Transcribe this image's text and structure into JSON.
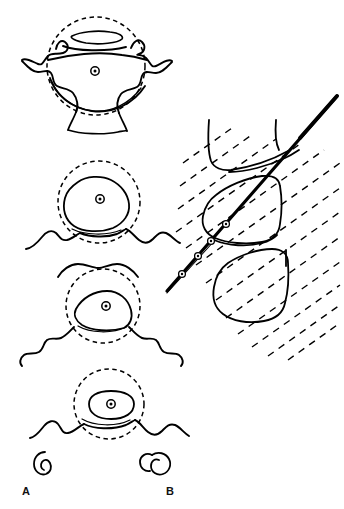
{
  "figure": {
    "background_color": "#ffffff",
    "ink_color": "#000000",
    "width": 344,
    "height": 509
  },
  "panels": [
    {
      "id": "panel-a",
      "label": "A",
      "label_position": {
        "x": 22,
        "y": 486
      },
      "description": "Four axial vertebral cross-sections, superior to inferior, each inscribed by a dashed circle with a central bullseye target marker",
      "items": [
        {
          "id": "vertebra-1",
          "level_order": 1,
          "body_shape": "lenticular-slit",
          "marker": "bullseye-target",
          "marker_position": {
            "x": 95,
            "y": 71
          },
          "circle_center": {
            "x": 96,
            "y": 66
          },
          "circle_radius": 49
        },
        {
          "id": "vertebra-2",
          "level_order": 2,
          "body_shape": "rounded-hexagon",
          "marker": "bullseye-target",
          "marker_position": {
            "x": 100,
            "y": 199
          },
          "circle_center": {
            "x": 99,
            "y": 202
          },
          "circle_radius": 41
        },
        {
          "id": "vertebra-3",
          "level_order": 3,
          "body_shape": "flattened-wedge",
          "marker": "bullseye-target",
          "marker_position": {
            "x": 106,
            "y": 306
          },
          "circle_center": {
            "x": 103,
            "y": 306
          },
          "circle_radius": 37
        },
        {
          "id": "vertebra-4",
          "level_order": 4,
          "body_shape": "elongated-oval",
          "marker": "bullseye-target",
          "marker_position": {
            "x": 111,
            "y": 404
          },
          "circle_center": {
            "x": 109,
            "y": 404
          },
          "circle_radius": 35
        }
      ]
    },
    {
      "id": "panel-b",
      "label": "B",
      "label_position": {
        "x": 166,
        "y": 486
      },
      "description": "Lateral view of two vertebral bodies with an obliquely advancing needle and parallel dashed beam lines",
      "needle": {
        "id": "needle-trajectory",
        "tip": {
          "x": 167,
          "y": 291
        },
        "hub": {
          "x": 337,
          "y": 96
        },
        "angle_degrees": -49,
        "marker_count": 4,
        "markers": [
          {
            "x": 182,
            "y": 274
          },
          {
            "x": 198,
            "y": 256
          },
          {
            "x": 211,
            "y": 241
          },
          {
            "x": 226,
            "y": 224
          }
        ]
      },
      "vertebral_bodies": [
        {
          "id": "vertebra-upper",
          "shape": "tapered-block"
        },
        {
          "id": "vertebra-middle",
          "shape": "rounded-rhomboid"
        },
        {
          "id": "vertebra-lower",
          "shape": "rounded-rhomboid"
        }
      ],
      "beam_lines": {
        "id": "dashed-beam-lines",
        "style": "dashed",
        "angle_degrees": -35,
        "count": 13
      }
    }
  ]
}
